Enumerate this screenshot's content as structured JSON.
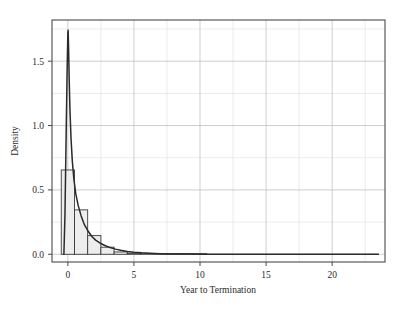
{
  "chart_data": {
    "type": "bar",
    "title": "",
    "subtitle": "",
    "xlabel": "Year to Termination",
    "ylabel": "Density",
    "xlim": [
      -1.2,
      24.0
    ],
    "ylim": [
      -0.06,
      1.82
    ],
    "xticks": [
      0,
      5,
      10,
      15,
      20
    ],
    "xticklabels": [
      "0",
      "5",
      "10",
      "15",
      "20"
    ],
    "yticks": [
      0.0,
      0.5,
      1.0,
      1.5
    ],
    "yticklabels": [
      "0.0",
      "0.5",
      "1.0",
      "1.5"
    ],
    "x_minor_ticks": [
      -2.5,
      2.5,
      7.5,
      12.5,
      17.5,
      22.5
    ],
    "y_minor_ticks": [
      0.25,
      0.75,
      1.25,
      1.75
    ],
    "grid": true,
    "legend": null,
    "histogram": {
      "bin_width": 1.0,
      "bin_edges": [
        -0.5,
        0.5,
        1.5,
        2.5,
        3.5,
        4.5,
        5.5,
        6.5,
        7.5,
        8.5,
        9.5,
        10.5
      ],
      "bin_centers": [
        0,
        1,
        2,
        3,
        4,
        5,
        6,
        7,
        8,
        9,
        10
      ],
      "densities": [
        0.655,
        0.345,
        0.145,
        0.055,
        0.018,
        0.008,
        0.004,
        0.002,
        0.001,
        0.001,
        0.0
      ],
      "fill_color": "#ededed",
      "edge_color": "#3a3a3a"
    },
    "density_curve": {
      "name": "kernel density estimate",
      "color": "#2a2a2a",
      "x": [
        -0.3,
        -0.22,
        -0.14,
        -0.06,
        0.0,
        0.02,
        0.06,
        0.1,
        0.16,
        0.24,
        0.34,
        0.46,
        0.6,
        0.78,
        1.0,
        1.25,
        1.5,
        1.8,
        2.1,
        2.45,
        2.8,
        3.2,
        3.6,
        4.0,
        4.5,
        5.0,
        5.6,
        6.2,
        7.0,
        8.0,
        9.0,
        10.5,
        12.0,
        14.0,
        16.0,
        18.0,
        20.0,
        22.0,
        23.5
      ],
      "y": [
        0.0,
        0.3,
        0.85,
        1.4,
        1.72,
        1.74,
        1.58,
        1.36,
        1.12,
        0.9,
        0.72,
        0.58,
        0.47,
        0.38,
        0.3,
        0.23,
        0.185,
        0.14,
        0.11,
        0.086,
        0.068,
        0.052,
        0.04,
        0.031,
        0.022,
        0.016,
        0.011,
        0.008,
        0.005,
        0.003,
        0.002,
        0.001,
        0.001,
        0.0,
        0.0,
        0.0,
        0.0,
        0.0,
        0.0
      ]
    },
    "colors": {
      "background": "#ffffff",
      "frame": "#4a4a4a",
      "grid_major": "#b9b9b9",
      "grid_minor": "#dedede",
      "text": "#2b2b2b"
    }
  }
}
